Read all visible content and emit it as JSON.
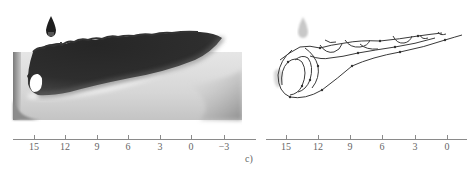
{
  "figure": {
    "label": "c)"
  },
  "panels": [
    {
      "id": "left",
      "kind": "grayscale-field",
      "axis": {
        "ticks": [
          {
            "value": 15,
            "label": "15",
            "x": 34
          },
          {
            "value": 12,
            "label": "12",
            "x": 65
          },
          {
            "value": 9,
            "label": "9",
            "x": 97
          },
          {
            "value": 6,
            "label": "6",
            "x": 128
          },
          {
            "value": 3,
            "label": "3",
            "x": 160
          },
          {
            "value": 0,
            "label": "0",
            "x": 191
          },
          {
            "value": -3,
            "label": "−3",
            "x": 224
          }
        ],
        "line_x": [
          13,
          256
        ]
      }
    },
    {
      "id": "right",
      "kind": "streamlines",
      "axis": {
        "ticks": [
          {
            "value": 15,
            "label": "15",
            "x": 36
          },
          {
            "value": 12,
            "label": "12",
            "x": 68
          },
          {
            "value": 9,
            "label": "9",
            "x": 100
          },
          {
            "value": 6,
            "label": "6",
            "x": 132
          },
          {
            "value": 3,
            "label": "3",
            "x": 165
          },
          {
            "value": 0,
            "label": "0",
            "x": 197
          }
        ],
        "line_x": [
          16,
          217
        ]
      }
    }
  ],
  "colors": {
    "dark_fluid": "#2b2b2b",
    "light_field": "#d9d9d9",
    "mid_gray": "#a0a0a0",
    "streamline": "#3a3a3a",
    "axis": "#8a8a8a"
  }
}
